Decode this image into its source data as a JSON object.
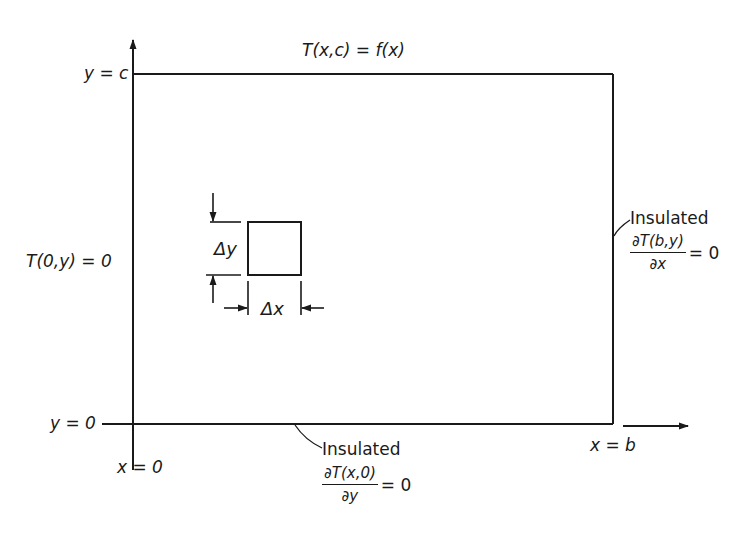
{
  "diagram": {
    "type": "heat-conduction-domain",
    "colors": {
      "ink": "#1a1a1a",
      "background": "#ffffff"
    },
    "axes": {
      "y_axis_label_top": "y = c",
      "y_axis_label_bottom": "y = 0",
      "x_axis_label_left": "x = 0",
      "x_axis_label_right": "x = b"
    },
    "boundaries": {
      "top": {
        "condition": "T(x,c) = f(x)"
      },
      "left": {
        "condition": "T(0,y) = 0"
      },
      "right": {
        "label": "Insulated",
        "numerator": "∂T(b,y)",
        "denominator": "∂x",
        "rhs": "= 0"
      },
      "bottom": {
        "label": "Insulated",
        "numerator": "∂T(x,0)",
        "denominator": "∂y",
        "rhs": "= 0"
      }
    },
    "element": {
      "dy_label": "Δy",
      "dx_label": "Δx"
    }
  }
}
